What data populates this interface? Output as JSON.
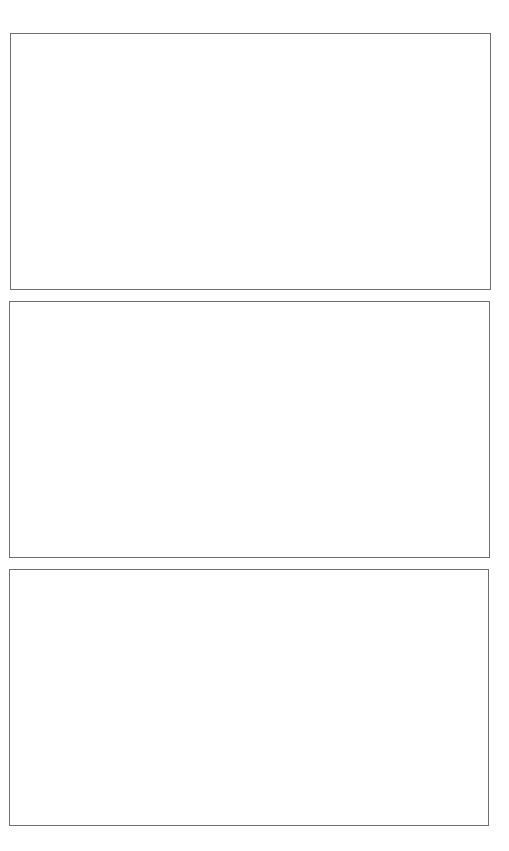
{
  "page": {
    "background": "#ffffff",
    "border_color": "#6e6e6e"
  },
  "panels": [
    {
      "id": "panel-1",
      "content": ""
    },
    {
      "id": "panel-2",
      "content": ""
    },
    {
      "id": "panel-3",
      "content": ""
    }
  ]
}
